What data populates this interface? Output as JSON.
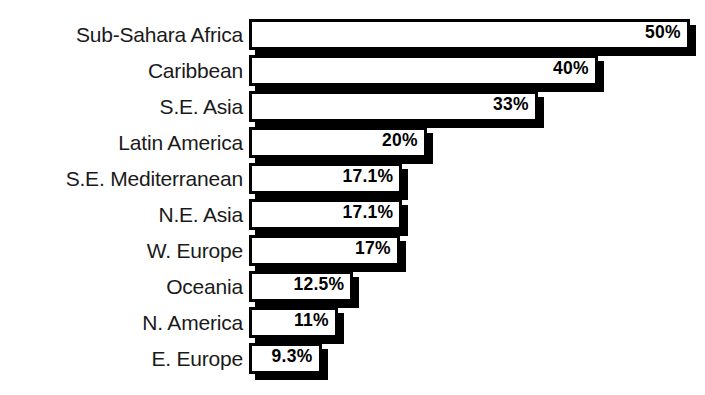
{
  "chart_data": {
    "type": "bar",
    "orientation": "horizontal",
    "title": "",
    "xlabel": "",
    "ylabel": "",
    "grid": false,
    "legend": null,
    "xlim": [
      0,
      50
    ],
    "value_suffix": "%",
    "categories": [
      "Sub-Sahara Africa",
      "Caribbean",
      "S.E. Asia",
      "Latin America",
      "S.E. Mediterranean",
      "N.E. Asia",
      "W. Europe",
      "Oceania",
      "N. America",
      "E. Europe"
    ],
    "values": [
      50,
      40,
      33,
      20,
      17.1,
      17.1,
      17,
      12.5,
      11,
      9.3
    ],
    "value_labels": [
      "50%",
      "40%",
      "33%",
      "20%",
      "17.1%",
      "17.1%",
      "17%",
      "12.5%",
      "11%",
      "9.3%"
    ],
    "bar_pixel_widths": [
      441,
      349,
      289,
      178,
      153,
      153,
      151,
      104,
      89,
      73
    ]
  },
  "style": {
    "background": "#ffffff",
    "bar_fill": "#ffffff",
    "bar_outline": "#000000",
    "shadow_color": "#000000",
    "label_color": "#1a1a1a"
  }
}
